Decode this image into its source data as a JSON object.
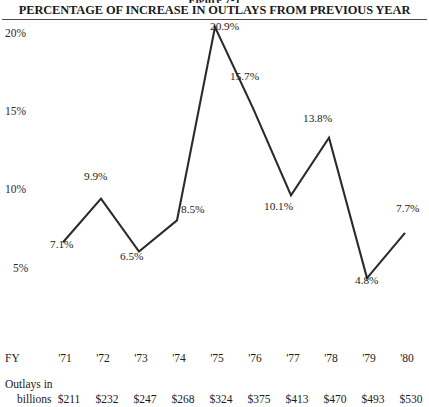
{
  "figure": {
    "number": "Figure 7-1",
    "title": "PERCENTAGE OF INCREASE IN OUTLAYS FROM PREVIOUS YEAR"
  },
  "axis": {
    "y_ticks": [
      "20%",
      "15%",
      "10%",
      "5%"
    ]
  },
  "table": {
    "fy_row_label": "FY",
    "outlays_label_line1": "Outlays in",
    "outlays_label_line2": "billions",
    "fy_values": [
      "'71",
      "'72",
      "'73",
      "'74",
      "'75",
      "'76",
      "'77",
      "'78",
      "'79",
      "'80"
    ],
    "outlays_values": [
      "$211",
      "$232",
      "$247",
      "$268",
      "$324",
      "$375",
      "$413",
      "$470",
      "$493",
      "$530"
    ]
  },
  "point_labels": [
    "7.1%",
    "9.9%",
    "6.5%",
    "8.5%",
    "20.9%",
    "15.7%",
    "10.1%",
    "13.8%",
    "4.8%",
    "7.7%"
  ],
  "colors": {
    "line": "#2b2b2b",
    "rule": "#4a4a4a",
    "text": "#1b1b1b",
    "background": "#ffffff"
  },
  "chart_data": {
    "type": "line",
    "title": "PERCENTAGE OF INCREASE IN OUTLAYS FROM PREVIOUS YEAR",
    "subtitle": "Figure 7-1",
    "xlabel": "FY",
    "ylabel": "",
    "categories": [
      "'71",
      "'72",
      "'73",
      "'74",
      "'75",
      "'76",
      "'77",
      "'78",
      "'79",
      "'80"
    ],
    "values": [
      7.1,
      9.9,
      6.5,
      8.5,
      20.9,
      15.7,
      10.1,
      13.8,
      4.8,
      7.7
    ],
    "data_labels": [
      "7.1%",
      "9.9%",
      "6.5%",
      "8.5%",
      "20.9%",
      "15.7%",
      "10.1%",
      "13.8%",
      "4.8%",
      "7.7%"
    ],
    "ylim": [
      5,
      20.9
    ],
    "ytick_values": [
      20,
      15,
      10,
      5
    ],
    "ytick_labels": [
      "20%",
      "15%",
      "10%",
      "5%"
    ],
    "grid": false,
    "legend": "none",
    "series": [
      {
        "name": "Percentage increase in outlays from previous year",
        "values": [
          7.1,
          9.9,
          6.5,
          8.5,
          20.9,
          15.7,
          10.1,
          13.8,
          4.8,
          7.7
        ]
      },
      {
        "name": "Outlays in billions (dollars)",
        "values": [
          211,
          232,
          247,
          268,
          324,
          375,
          413,
          470,
          493,
          530
        ]
      }
    ],
    "note": "Peak at FY '75 (20.9%) is clipped by the title rule at the top of the plot area."
  }
}
